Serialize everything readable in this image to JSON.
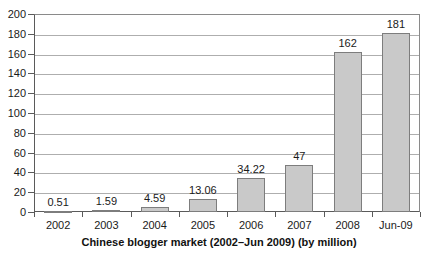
{
  "chart_data": {
    "type": "bar",
    "title": "",
    "xlabel": "Chinese blogger market (2002–Jun 2009) (by million)",
    "ylabel": "",
    "categories": [
      "2002",
      "2003",
      "2004",
      "2005",
      "2006",
      "2007",
      "2008",
      "Jun-09"
    ],
    "values": [
      0.51,
      1.59,
      4.59,
      13.06,
      34.22,
      47,
      162,
      181
    ],
    "value_labels": [
      "0.51",
      "1.59",
      "4.59",
      "13.06",
      "34.22",
      "47",
      "162",
      "181"
    ],
    "ylim": [
      0,
      200
    ],
    "ytick_step": 20,
    "ytick_labels": [
      "0",
      "20",
      "40",
      "60",
      "80",
      "100",
      "120",
      "140",
      "160",
      "180",
      "200"
    ],
    "grid": true,
    "legend": "none",
    "series": [
      {
        "name": "Chinese blogger market",
        "values": [
          0.51,
          1.59,
          4.59,
          13.06,
          34.22,
          47,
          162,
          181
        ]
      }
    ],
    "colors": {
      "bar_fill": "#c9c9c9",
      "bar_stroke": "#7d7d7d",
      "gridline": "#aeaeae",
      "axis": "#5a5a5a",
      "text": "#1a1a1a",
      "background": "#ffffff"
    }
  }
}
